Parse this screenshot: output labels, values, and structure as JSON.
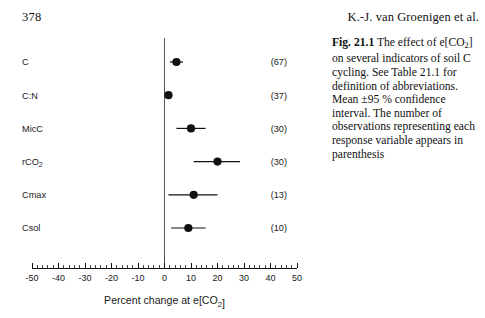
{
  "page": {
    "number": "378",
    "running_head": "K.-J. van Groenigen et al."
  },
  "caption": {
    "label": "Fig. 21.1",
    "text": "The effect of e[CO2] on several indicators of soil C cycling. See Table 21.1 for definition of abbreviations. Mean ±95 % confidence interval. The number of observations representing each response variable appears in parenthesis"
  },
  "chart_data": {
    "type": "scatter",
    "orientation": "horizontal",
    "title": "",
    "xlabel": "Percent change at e[CO2]",
    "ylabel": "",
    "xlim": [
      -50,
      50
    ],
    "xticks": [
      -50,
      -40,
      -30,
      -20,
      -10,
      0,
      10,
      20,
      30,
      40,
      50
    ],
    "xtick_labels": [
      "-50",
      "-40",
      "-30",
      "-20",
      "-10",
      "0",
      "10",
      "20",
      "30",
      "40",
      "50"
    ],
    "minor_tick_interval": 2,
    "grid": false,
    "legend": null,
    "zero_reference_line": 0,
    "error_type": "95 % confidence interval",
    "categories": [
      "C",
      "C:N",
      "MicC",
      "rCO2",
      "Cmax",
      "Csol"
    ],
    "category_labels": [
      "C",
      "C:N",
      "MicC",
      "rCO₂",
      "Cmax",
      "Csol"
    ],
    "n_labels": [
      "(67)",
      "(37)",
      "(30)",
      "(30)",
      "(13)",
      "(10)"
    ],
    "n_values": [
      67,
      37,
      30,
      30,
      13,
      10
    ],
    "values": [
      4.5,
      1.5,
      10.0,
      20.0,
      11.0,
      9.0
    ],
    "ci_low": [
      2.0,
      0.5,
      4.5,
      11.0,
      1.5,
      2.5
    ],
    "ci_high": [
      7.0,
      2.5,
      15.5,
      28.5,
      20.0,
      15.5
    ]
  },
  "colors": {
    "marker": "#111111",
    "axis": "#111111",
    "zero_line": "#555555",
    "text": "#1a1a1a",
    "background": "#ffffff"
  }
}
